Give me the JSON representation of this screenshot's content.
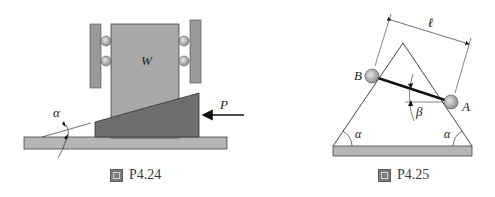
{
  "figures": [
    {
      "id": "P4.24",
      "caption": {
        "icon": "figure-icon",
        "label": "P4.24"
      },
      "labels": {
        "weight": "W",
        "force": "P",
        "angle": "α"
      },
      "colors": {
        "block": "#a8a8a8",
        "wedge": "#6e6e6e",
        "ground": "#b5b5b5",
        "wall": "#9a9a9a",
        "roller": "#c4c4c4"
      }
    },
    {
      "id": "P4.25",
      "caption": {
        "icon": "figure-icon",
        "label": "P4.25"
      },
      "labels": {
        "point_b": "B",
        "point_a": "A",
        "length": "ℓ",
        "rod_angle": "β",
        "left_base_angle": "α",
        "right_base_angle": "α"
      },
      "colors": {
        "ground": "#b5b5b5",
        "ball": "#b0b0b0",
        "rod": "#111111"
      }
    }
  ]
}
